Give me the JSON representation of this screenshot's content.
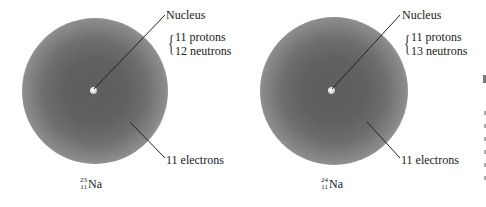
{
  "figure": {
    "panels": [
      {
        "isotope": {
          "mass_number": "23",
          "atomic_number": "11",
          "symbol": "Na"
        },
        "nucleus_label": "Nucleus",
        "composition": [
          "11 protons",
          "12 neutrons"
        ],
        "electrons_label": "11 electrons"
      },
      {
        "isotope": {
          "mass_number": "24",
          "atomic_number": "11",
          "symbol": "Na"
        },
        "nucleus_label": "Nucleus",
        "composition": [
          "11 protons",
          "13 neutrons"
        ],
        "electrons_label": "11 electrons"
      }
    ],
    "colors": {
      "cloud_core": "#5e5e5e",
      "cloud_edge": "#dcdcdc",
      "leader_line": "#222222"
    }
  }
}
